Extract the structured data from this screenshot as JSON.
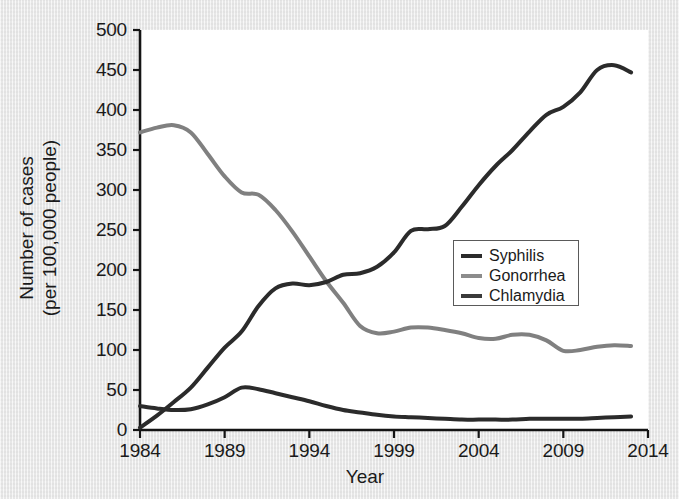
{
  "chart_data": {
    "type": "line",
    "title": "",
    "xlabel": "Year",
    "ylabel": "Number of cases (per 100,000 people)",
    "ylabel_line1": "Number of cases",
    "ylabel_line2": "(per 100,000 people)",
    "xlim": [
      1984,
      2014
    ],
    "ylim": [
      0,
      500
    ],
    "grid": false,
    "legend_position": "center-right",
    "xticks": [
      "1984",
      "1989",
      "1994",
      "1999",
      "2004",
      "2009",
      "2014"
    ],
    "xtick_values": [
      1984,
      1989,
      1994,
      1999,
      2004,
      2009,
      2014
    ],
    "yticks": [
      "0",
      "50",
      "100",
      "150",
      "200",
      "250",
      "300",
      "350",
      "400",
      "450",
      "500"
    ],
    "ytick_values": [
      0,
      50,
      100,
      150,
      200,
      250,
      300,
      350,
      400,
      450,
      500
    ],
    "x": [
      1984,
      1985,
      1986,
      1987,
      1988,
      1989,
      1990,
      1991,
      1992,
      1993,
      1994,
      1995,
      1996,
      1997,
      1998,
      1999,
      2000,
      2001,
      2002,
      2003,
      2004,
      2005,
      2006,
      2007,
      2008,
      2009,
      2010,
      2011,
      2012,
      2013
    ],
    "series": [
      {
        "name": "Syphilis",
        "color": "#2b2b2b",
        "values": [
          30,
          27,
          25,
          26,
          32,
          41,
          53,
          51,
          46,
          41,
          36,
          30,
          25,
          22,
          19,
          17,
          16,
          15,
          14,
          13,
          13,
          13,
          13,
          14,
          14,
          14,
          14,
          15,
          16,
          17
        ]
      },
      {
        "name": "Gonorrhea",
        "color": "#808080",
        "values": [
          372,
          378,
          381,
          372,
          345,
          317,
          297,
          294,
          275,
          248,
          217,
          186,
          159,
          130,
          121,
          123,
          128,
          128,
          125,
          121,
          115,
          114,
          119,
          119,
          112,
          99,
          100,
          104,
          106,
          105
        ]
      },
      {
        "name": "Chlamydia",
        "color": "#2b2b2b",
        "values": [
          3,
          18,
          35,
          53,
          78,
          103,
          123,
          155,
          177,
          183,
          181,
          185,
          194,
          196,
          204,
          222,
          249,
          251,
          255,
          279,
          306,
          330,
          350,
          373,
          394,
          404,
          422,
          450,
          456,
          447
        ]
      }
    ]
  },
  "legend": {
    "entries": [
      {
        "label": "Syphilis",
        "color": "#2b2b2b"
      },
      {
        "label": "Gonorrhea",
        "color": "#8c8c8c"
      },
      {
        "label": "Chlamydia",
        "color": "#3a3a3a"
      }
    ]
  },
  "axes": {
    "axis_color": "#141414"
  }
}
